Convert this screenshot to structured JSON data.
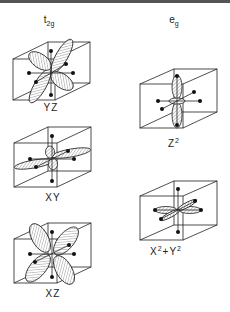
{
  "figure": {
    "groups": [
      {
        "id": "t2g",
        "label_main": "t",
        "label_sub": "2g"
      },
      {
        "id": "eg",
        "label_main": "e",
        "label_sub": "g"
      }
    ],
    "orbitals": [
      {
        "id": "yz",
        "group": "t2g",
        "label": "YZ",
        "label_base": "YZ",
        "label_sup": ""
      },
      {
        "id": "xy",
        "group": "t2g",
        "label": "XY",
        "label_base": "XY",
        "label_sup": ""
      },
      {
        "id": "xz",
        "group": "t2g",
        "label": "XZ",
        "label_base": "XZ",
        "label_sup": ""
      },
      {
        "id": "z2",
        "group": "eg",
        "label": "Z2",
        "label_base": "Z",
        "label_sup": "2"
      },
      {
        "id": "x2y2",
        "group": "eg",
        "label": "X2+Y2",
        "label_x": "X",
        "label_plus": "+",
        "label_y": "Y",
        "label_sup": "2"
      }
    ],
    "colors": {
      "line": "#222222",
      "hatch": "#777777",
      "background": "#ffffff"
    }
  }
}
